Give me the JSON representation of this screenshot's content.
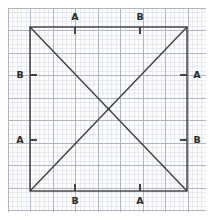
{
  "figure": {
    "background_color": "#ffffff",
    "paper_color": "#fdfdfd",
    "minor_grid_color": "#d8dde4",
    "major_grid_color": "#a8b0bb",
    "shape_color": "#3a3a3a",
    "tick_color": "#444444",
    "label_color": "#2b2b2b"
  },
  "grid": {
    "minor_spacing_px": 4.5,
    "major_spacing_px": 22.5,
    "paper_left": 8,
    "paper_top": 8,
    "paper_right": 206,
    "paper_bottom": 212
  },
  "square": {
    "left": 30,
    "top": 27,
    "right": 187,
    "bottom": 191,
    "width": 157,
    "height": 164
  },
  "diagonals": [
    {
      "name": "diagonal-tl-br",
      "x1": 30,
      "y1": 27,
      "x2": 187,
      "y2": 191
    },
    {
      "name": "diagonal-bl-tr",
      "x1": 30,
      "y1": 191,
      "x2": 187,
      "y2": 27
    }
  ],
  "center": {
    "x": 108.5,
    "y": 109
  },
  "marks": [
    {
      "id": "top-a",
      "label": "A",
      "edge": "top",
      "point_x": 75,
      "point_y": 27,
      "tick_x1": 75,
      "tick_y1": 27,
      "tick_x2": 75,
      "tick_y2": 34,
      "label_x": 75,
      "label_y": 17
    },
    {
      "id": "top-b",
      "label": "B",
      "edge": "top",
      "point_x": 140,
      "point_y": 27,
      "tick_x1": 140,
      "tick_y1": 27,
      "tick_x2": 140,
      "tick_y2": 34,
      "label_x": 140,
      "label_y": 17
    },
    {
      "id": "left-b",
      "label": "B",
      "edge": "left",
      "point_x": 30,
      "point_y": 75,
      "tick_x1": 30,
      "tick_y1": 75,
      "tick_x2": 37,
      "tick_y2": 75,
      "label_x": 20,
      "label_y": 75
    },
    {
      "id": "left-a",
      "label": "A",
      "edge": "left",
      "point_x": 30,
      "point_y": 140,
      "tick_x1": 30,
      "tick_y1": 140,
      "tick_x2": 37,
      "tick_y2": 140,
      "label_x": 20,
      "label_y": 140
    },
    {
      "id": "right-a",
      "label": "A",
      "edge": "right",
      "point_x": 187,
      "point_y": 75,
      "tick_x1": 180,
      "tick_y1": 75,
      "tick_x2": 187,
      "tick_y2": 75,
      "label_x": 197,
      "label_y": 75
    },
    {
      "id": "right-b",
      "label": "B",
      "edge": "right",
      "point_x": 187,
      "point_y": 140,
      "tick_x1": 180,
      "tick_y1": 140,
      "tick_x2": 187,
      "tick_y2": 140,
      "label_x": 197,
      "label_y": 140
    },
    {
      "id": "bottom-b",
      "label": "B",
      "edge": "bottom",
      "point_x": 75,
      "point_y": 191,
      "tick_x1": 75,
      "tick_y1": 184,
      "tick_x2": 75,
      "tick_y2": 191,
      "label_x": 75,
      "label_y": 201
    },
    {
      "id": "bottom-a",
      "label": "A",
      "edge": "bottom",
      "point_x": 140,
      "point_y": 191,
      "tick_x1": 140,
      "tick_y1": 184,
      "tick_x2": 140,
      "tick_y2": 191,
      "label_x": 140,
      "label_y": 201
    }
  ]
}
